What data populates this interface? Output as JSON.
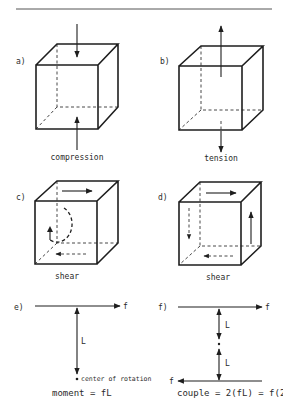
{
  "header": {
    "rule": true
  },
  "panels": {
    "a": {
      "label": "a)",
      "caption": "compression",
      "type": "cube",
      "forces": [
        "top-down",
        "bottom-up"
      ]
    },
    "b": {
      "label": "b)",
      "caption": "tension",
      "type": "cube",
      "forces": [
        "top-up",
        "bottom-down"
      ]
    },
    "c": {
      "label": "c)",
      "caption": "shear",
      "type": "cube",
      "forces": [
        "top-right",
        "bottom-left-dashed",
        "rotation-ccw-dashed"
      ]
    },
    "d": {
      "label": "d)",
      "caption": "shear",
      "type": "cube",
      "forces": [
        "top-right",
        "bottom-left-dashed",
        "right-up",
        "left-down-dashed"
      ]
    },
    "e": {
      "label": "e)",
      "force_label": "f",
      "length_label": "L",
      "point_label": "center of rotation",
      "equation": "moment = fL"
    },
    "f": {
      "label": "f)",
      "force_label_top": "f",
      "force_label_bottom": "f",
      "length_label_1": "L",
      "length_label_2": "L",
      "equation": "couple = 2(fL) = f(2L)"
    }
  }
}
